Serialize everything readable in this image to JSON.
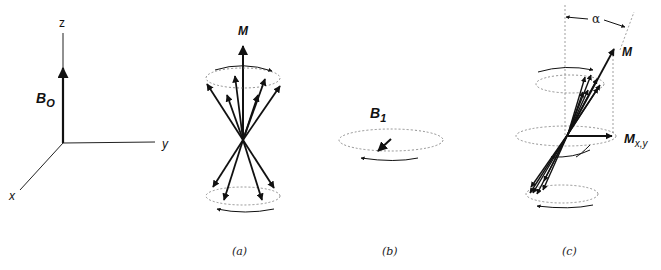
{
  "axes": {
    "z_label": "z",
    "y_label": "y",
    "x_label": "x",
    "field_label_main": "B",
    "field_label_sub": "O"
  },
  "panel_a": {
    "caption": "(a)",
    "vector_label": "M",
    "upper_cone_spins": 6,
    "lower_cone_spins": 4
  },
  "panel_b": {
    "caption": "(b)",
    "field_label_main": "B",
    "field_label_sub": "1"
  },
  "panel_c": {
    "caption": "(c)",
    "vector_label": "M",
    "transverse_label_main": "M",
    "transverse_label_sub": "x,y",
    "angle_label": "α"
  },
  "colors": {
    "ink": "#111111",
    "dashed": "#777777"
  }
}
